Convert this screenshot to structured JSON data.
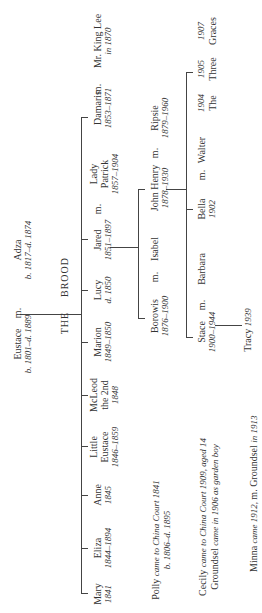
{
  "title": {
    "left": "THE",
    "right": "BROOD"
  },
  "parents": {
    "father": {
      "name": "Eustace",
      "dates": "b. 1801–d. 1889"
    },
    "marriage": "m.",
    "mother": {
      "name": "Adza",
      "dates": "b. 1817–d. 1874"
    }
  },
  "children": [
    {
      "name": "Mary",
      "dates": "1841"
    },
    {
      "name": "Eliza",
      "dates": "1844–1894"
    },
    {
      "name": "Anne",
      "dates": "1845"
    },
    {
      "name": "Little Eustace",
      "line1": "Little",
      "line2": "Eustace",
      "dates": "1846–1859"
    },
    {
      "name": "McLeod the 2nd",
      "line1": "McLeod",
      "line2": "the 2nd",
      "dates": "1848"
    },
    {
      "name": "Marion",
      "dates": "1849–1850"
    },
    {
      "name": "Lucy",
      "dates": "d. 1850"
    },
    {
      "name": "Jared",
      "dates": "1851–1897",
      "spouse_m": "m.",
      "spouse": {
        "line1": "Lady",
        "line2": "Patrick",
        "dates": "1857–1904"
      }
    },
    {
      "name": "Damaris",
      "dates": "1853–1871",
      "spouse_m": "m.",
      "spouse": {
        "line1": "Mr. King Lee",
        "line2": "in 1870"
      }
    }
  ],
  "grandchildren": [
    {
      "name": "Borowis",
      "dates": "1876–1900",
      "spouse_m": "m.",
      "spouse": "Isabel"
    },
    {
      "name": "John Henry",
      "dates": "1878–1930",
      "spouse_m": "m.",
      "spouse": {
        "name": "Ripsie",
        "dates": "1879–1960"
      }
    }
  ],
  "great_grandchildren": [
    {
      "name": "Stace",
      "dates": "1900–1944",
      "spouse_m": "m.",
      "spouse": "Barbara"
    },
    {
      "name": "Bella",
      "dates": "1902",
      "spouse_m": "m.",
      "spouse": "Walter"
    },
    {
      "name": "The Three Graces",
      "parts": [
        {
          "year": "1904",
          "word": "The"
        },
        {
          "year": "1905",
          "word": "Three"
        },
        {
          "year": "1907",
          "word": "Graces"
        }
      ]
    }
  ],
  "great_great_grandchildren": [
    {
      "name": "Tracy",
      "dates": "1939"
    }
  ],
  "notes": {
    "polly": {
      "line1_a": "Polly ",
      "line1_b": "came to China Court 1841",
      "line2": "b. 1806–d. 1895"
    },
    "cecily": {
      "line1_a": "Cecily ",
      "line1_b": "came to China Court 1909, aged 14",
      "line2_a": "Groundsel ",
      "line2_b": "came in 1906 as garden boy"
    },
    "minna": {
      "a": "Minna ",
      "b": "came 1912, ",
      "c": "m. Groundsel ",
      "d": "in 1913"
    }
  }
}
